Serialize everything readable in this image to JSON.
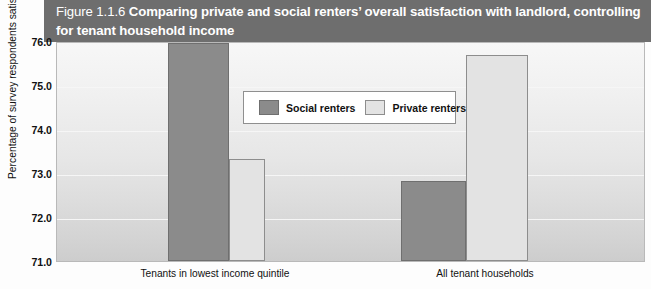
{
  "figure": {
    "number": "Figure 1.1.6",
    "title": "Comparing private and social renters’ overall satisfaction with landlord, controlling for tenant household income",
    "banner_color": "#6e6e6e"
  },
  "legend": {
    "position": "inside-top-center",
    "entries": [
      {
        "label": "Social renters",
        "color": "#8b8b8b",
        "swatch": "social-renters-swatch"
      },
      {
        "label": "Private renters",
        "color": "#e3e3e3",
        "swatch": "private-renters-swatch"
      }
    ]
  },
  "axes": {
    "y_title": "Percentage of survey respondents satisfied or very satisfied",
    "y_ticks": [
      "76.0",
      "75.0",
      "74.0",
      "73.0",
      "72.0",
      "71.0"
    ],
    "x_categories": [
      "Tenants in lowest income quintile",
      "All tenant households"
    ]
  },
  "chart_data": {
    "type": "bar",
    "title": "Comparing private and social renters’ overall satisfaction with landlord, controlling for tenant household income",
    "subtitle": "",
    "xlabel": "",
    "ylabel": "Percentage of survey respondents satisfied or very satisfied",
    "categories": [
      "Tenants in lowest income quintile",
      "All tenant households"
    ],
    "series": [
      {
        "name": "Social renters",
        "color": "#8b8b8b",
        "values": [
          76.1,
          72.83
        ]
      },
      {
        "name": "Private renters",
        "color": "#e3e3e3",
        "values": [
          73.33,
          75.72
        ]
      }
    ],
    "ylim": [
      71.0,
      76.0
    ],
    "yticks": [
      71.0,
      72.0,
      73.0,
      74.0,
      75.0,
      76.0
    ],
    "grid": true,
    "legend_position": "upper center (inside plot)"
  }
}
